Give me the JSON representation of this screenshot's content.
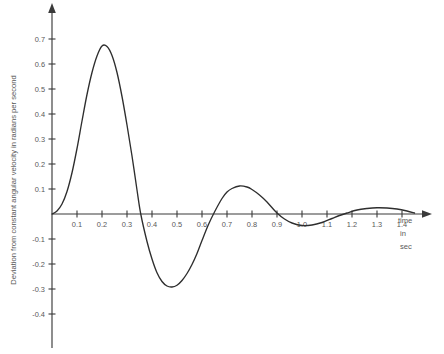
{
  "chart_data": {
    "type": "line",
    "title": "",
    "xlabel": "time in sec",
    "xlabel_lines": [
      "time",
      "in",
      "sec"
    ],
    "ylabel": "Deviation from constant angular velocity in radians per second",
    "xlim": [
      0.0,
      1.52
    ],
    "ylim": [
      -0.45,
      0.76
    ],
    "grid": false,
    "legend": "none",
    "line_color": "#2e2e2e",
    "axis_color": "#3a3a3a",
    "background_color": "#ffffff",
    "xticks": [
      0.1,
      0.2,
      0.3,
      0.4,
      0.5,
      0.6,
      0.7,
      0.8,
      0.9,
      1.0,
      1.1,
      1.2,
      1.3,
      1.4
    ],
    "xtick_labels": [
      "0.1",
      "0.2",
      "0.3",
      "0.4",
      "0.5",
      "0.6",
      "0.7",
      "0.8",
      "0.9",
      "1.0",
      "1.1",
      "1.2",
      "1.3",
      "1.4"
    ],
    "yticks": [
      0.7,
      0.6,
      0.5,
      0.4,
      0.3,
      0.2,
      0.1,
      -0.1,
      -0.2,
      -0.3,
      -0.4
    ],
    "ytick_labels": [
      "0.7",
      "0.6",
      "0.5",
      "0.4",
      "0.3",
      "0.2",
      "0.1",
      "-0.1",
      "-0.2",
      "-0.3",
      "-0.4"
    ],
    "x": [
      0.0,
      0.02,
      0.04,
      0.06,
      0.08,
      0.1,
      0.12,
      0.14,
      0.16,
      0.18,
      0.2,
      0.22,
      0.24,
      0.26,
      0.28,
      0.3,
      0.32,
      0.34,
      0.355,
      0.38,
      0.4,
      0.42,
      0.44,
      0.46,
      0.48,
      0.5,
      0.52,
      0.54,
      0.56,
      0.58,
      0.6,
      0.625,
      0.65,
      0.68,
      0.7,
      0.72,
      0.75,
      0.78,
      0.8,
      0.83,
      0.86,
      0.9,
      0.93,
      0.96,
      1.0,
      1.04,
      1.08,
      1.12,
      1.15,
      1.18,
      1.22,
      1.26,
      1.3,
      1.34,
      1.38,
      1.42,
      1.45
    ],
    "y": [
      0.0,
      0.012,
      0.04,
      0.09,
      0.165,
      0.262,
      0.372,
      0.478,
      0.566,
      0.632,
      0.672,
      0.67,
      0.634,
      0.566,
      0.47,
      0.356,
      0.232,
      0.096,
      0.0,
      -0.11,
      -0.18,
      -0.235,
      -0.27,
      -0.288,
      -0.292,
      -0.285,
      -0.266,
      -0.238,
      -0.202,
      -0.158,
      -0.106,
      -0.044,
      0.008,
      0.062,
      0.088,
      0.102,
      0.112,
      0.108,
      0.098,
      0.076,
      0.048,
      0.004,
      -0.02,
      -0.036,
      -0.046,
      -0.044,
      -0.034,
      -0.018,
      -0.006,
      0.004,
      0.016,
      0.022,
      0.025,
      0.024,
      0.02,
      0.012,
      0.004
    ],
    "annotations": {
      "first_peak": {
        "x": 0.205,
        "y": 0.675
      },
      "first_trough": {
        "x": 0.475,
        "y": -0.292
      },
      "second_peak": {
        "x": 0.75,
        "y": 0.112
      },
      "second_trough": {
        "x": 1.0,
        "y": -0.046
      },
      "third_peak": {
        "x": 1.3,
        "y": 0.025
      }
    }
  },
  "axes": {
    "y_axis_title": "Deviation from constant angular velocity in radians per second",
    "x_axis_title_line1": "time",
    "x_axis_title_line2": "in",
    "x_axis_title_line3": "sec"
  }
}
